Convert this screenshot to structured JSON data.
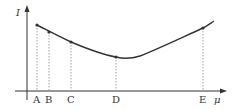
{
  "diagram": {
    "y_axis_label": "I",
    "x_axis_label": "μ",
    "points": [
      {
        "label": "A",
        "x": 37,
        "y": 25
      },
      {
        "label": "B",
        "x": 49,
        "y": 32
      },
      {
        "label": "C",
        "x": 71,
        "y": 42
      },
      {
        "label": "D",
        "x": 116,
        "y": 57
      },
      {
        "label": "E",
        "x": 203,
        "y": 28
      }
    ],
    "curve_description": "Decreasing then increasing curve with minimum just right of D",
    "colors": {
      "line": "#333333",
      "dashed": "#888888"
    }
  }
}
